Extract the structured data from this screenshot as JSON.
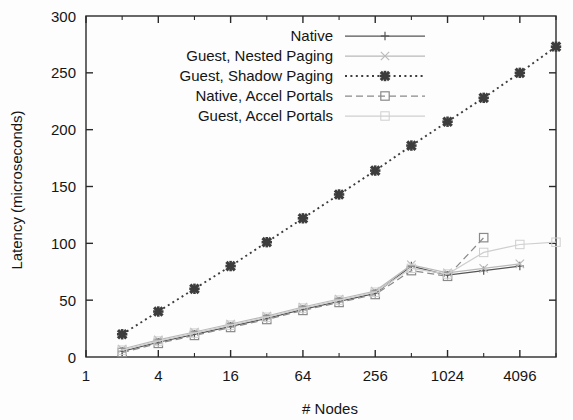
{
  "chart_data": {
    "type": "line",
    "title": "",
    "xlabel": "# Nodes",
    "ylabel": "Latency (microseconds)",
    "xscale": "log2",
    "xlim": [
      1,
      8192
    ],
    "ylim": [
      0,
      300
    ],
    "xticks": [
      1,
      4,
      16,
      64,
      256,
      1024,
      4096
    ],
    "xticklabels": [
      "1",
      "4",
      "16",
      "64",
      "256",
      "1024",
      "4096"
    ],
    "yticks": [
      0,
      50,
      100,
      150,
      200,
      250,
      300
    ],
    "yticklabels": [
      "0",
      "50",
      "100",
      "150",
      "200",
      "250",
      "300"
    ],
    "grid": false,
    "legend_position": "top-right-inside",
    "x": [
      2,
      4,
      8,
      16,
      32,
      64,
      128,
      256,
      512,
      1024,
      2048,
      4096,
      8192
    ],
    "series": [
      {
        "name": "Native",
        "marker": "plus",
        "linestyle": "solid",
        "color": "#555555",
        "values": [
          5,
          13,
          20,
          27,
          34,
          42,
          49,
          56,
          80,
          72,
          76,
          80,
          null
        ]
      },
      {
        "name": "Guest, Nested Paging",
        "marker": "cross-faint",
        "linestyle": "solid-faint",
        "color": "#b9b9b9",
        "values": [
          7,
          15,
          22,
          29,
          36,
          44,
          51,
          58,
          81,
          74,
          78,
          82,
          null
        ]
      },
      {
        "name": "Guest, Shadow Paging",
        "marker": "bold-x",
        "linestyle": "dotted",
        "color": "#3d3d3d",
        "values": [
          20,
          40,
          60,
          80,
          101,
          122,
          143,
          164,
          186,
          207,
          228,
          250,
          273
        ]
      },
      {
        "name": "Native, Accel Portals",
        "marker": "square",
        "linestyle": "dashed",
        "color": "#8a8a8a",
        "values": [
          4,
          12,
          19,
          26,
          33,
          41,
          48,
          55,
          76,
          71,
          105,
          null,
          null
        ]
      },
      {
        "name": "Guest, Accel Portals",
        "marker": "square-faint",
        "linestyle": "solid-faint",
        "color": "#cfcfcf",
        "values": [
          6,
          14,
          21,
          28,
          35,
          43,
          50,
          57,
          78,
          73,
          92,
          99,
          101
        ]
      }
    ]
  },
  "legend": {
    "items": [
      {
        "label": "Native"
      },
      {
        "label": "Guest, Nested Paging"
      },
      {
        "label": "Guest, Shadow Paging"
      },
      {
        "label": "Native, Accel Portals"
      },
      {
        "label": "Guest, Accel Portals"
      }
    ]
  }
}
